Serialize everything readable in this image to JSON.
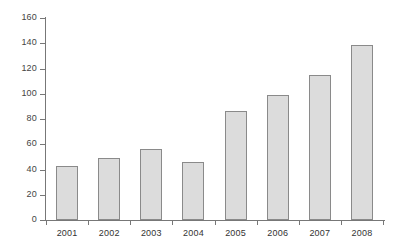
{
  "chart_data": {
    "type": "bar",
    "title": "",
    "subtitle": "",
    "xlabel": "",
    "ylabel": "",
    "categories": [
      "2001",
      "2002",
      "2003",
      "2004",
      "2005",
      "2006",
      "2007",
      "2008"
    ],
    "values": [
      43,
      49,
      56,
      46,
      86,
      99,
      115,
      139
    ],
    "ylim": [
      0,
      160
    ],
    "yticks": [
      0,
      20,
      40,
      60,
      80,
      100,
      120,
      140,
      160
    ],
    "ytick_labels": [
      "0",
      "20",
      "40",
      "60",
      "80",
      "100",
      "120",
      "140",
      "160"
    ],
    "grid": false,
    "legend": false,
    "legend_position": "none",
    "bar_fill_color": "#dcdcdc",
    "bar_border_color": "#8a8a8a",
    "axis_color": "#777777",
    "background_color": "#ffffff",
    "series": [
      {
        "name": "",
        "values": [
          43,
          49,
          56,
          46,
          86,
          99,
          115,
          139
        ]
      }
    ]
  }
}
